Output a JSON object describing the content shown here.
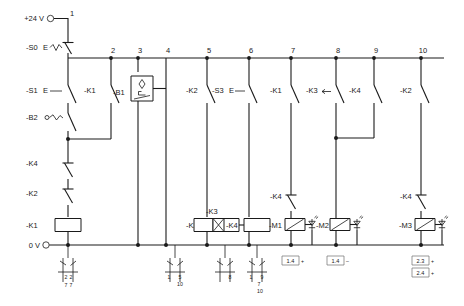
{
  "diagram": {
    "supply_top_label": "+24 V",
    "supply_bottom_label": "0 V",
    "line_color": "#1a1a1a",
    "background": "#ffffff",
    "rung_numbers": [
      "1",
      "2",
      "3",
      "4",
      "5",
      "6",
      "7",
      "8",
      "9",
      "10"
    ]
  },
  "devices": {
    "s0": "-S0",
    "s0_suffix": "E",
    "s1": "-S1",
    "s1_suffix": "E",
    "b2": "-B2",
    "b1": "-B1",
    "s3": "-S3",
    "s3_suffix": "E",
    "k1_contact_r2": "-K1",
    "k4_contact_left_a": "-K4",
    "k2_contact_left_b": "-K2",
    "k2_contact_r5": "-K2",
    "k1_contact_r7": "-K1",
    "k3_contact_r8": "-K3",
    "k4_contact_r9": "-K4",
    "k2_contact_r10": "-K2",
    "k4_contact_m1": "-K4",
    "k4_contact_m3": "-K4",
    "coil_k1": "-K1",
    "coil_k2": "-K2",
    "coil_k3": "-K3",
    "coil_k4": "-K4",
    "coil_m1": "-M1",
    "coil_m2": "-M2",
    "coil_m3": "-M3"
  },
  "cross_references": {
    "k1": {
      "left": "2",
      "right": "7"
    },
    "k2": {
      "left": "1",
      "right_top": "5",
      "right_bottom": "10"
    },
    "k3": {
      "left": "",
      "right": "8"
    },
    "k4": {
      "left": "1",
      "right_top": "9",
      "right_mid": "7",
      "right_bottom": "10"
    }
  },
  "valve_tags": [
    {
      "number": "1.4",
      "sign": "+"
    },
    {
      "number": "1.4",
      "sign": "–"
    },
    {
      "number": "2.3",
      "sign": "+"
    },
    {
      "number": "2.4",
      "sign": "+"
    }
  ],
  "bottom_left_tag": {
    "top": "2",
    "bottom": "7"
  }
}
